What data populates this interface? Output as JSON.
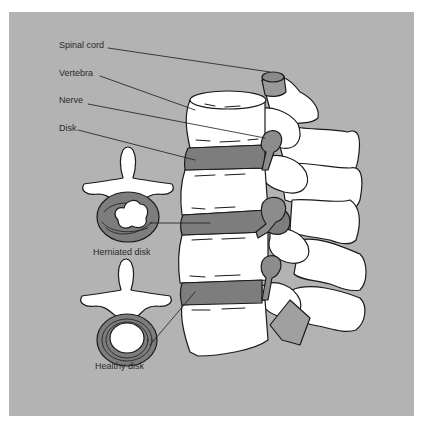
{
  "figure": {
    "colors": {
      "background": "#b3b3b3",
      "bone": "#ffffff",
      "disk": "#7d7d7d",
      "nerve": "#999999",
      "outline": "#1a1a1a"
    },
    "labels": {
      "spinal_cord": "Spinal cord",
      "vertebra": "Vertebra",
      "nerve": "Nerve",
      "disk": "Disk",
      "herniated_disk": "Herniated disk",
      "healthy_disk": "Healthy disk"
    }
  }
}
